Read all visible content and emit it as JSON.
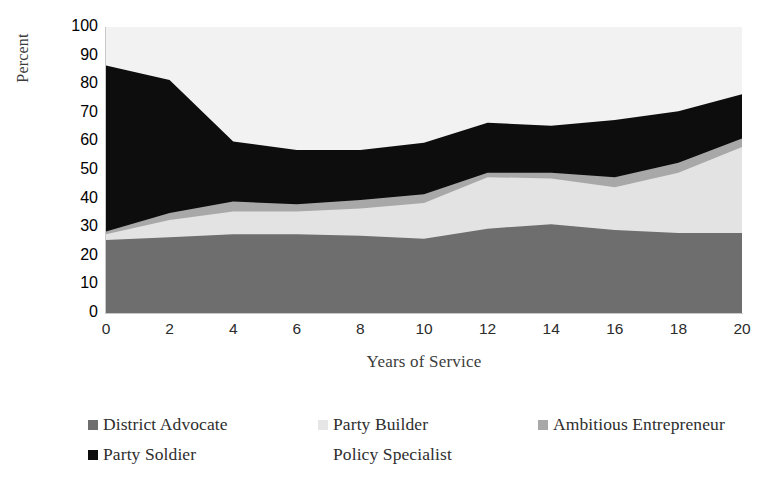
{
  "chart_data": {
    "type": "area",
    "stacked": true,
    "title": "",
    "xlabel": "Years of Service",
    "ylabel": "Percent",
    "x": [
      0,
      2,
      4,
      6,
      8,
      10,
      12,
      14,
      16,
      18,
      20
    ],
    "xlim": [
      0,
      20
    ],
    "ylim": [
      0,
      100
    ],
    "xticks": [
      "0",
      "2",
      "4",
      "6",
      "8",
      "10",
      "12",
      "14",
      "16",
      "18",
      "20"
    ],
    "yticks": [
      "0",
      "10",
      "20",
      "30",
      "40",
      "50",
      "60",
      "70",
      "80",
      "90",
      "100"
    ],
    "grid": false,
    "legend_position": "bottom",
    "series": [
      {
        "name": "District Advocate",
        "color": "#6e6e6e",
        "values": [
          25.5,
          26.5,
          27.5,
          27.5,
          27.0,
          26.0,
          29.5,
          31.0,
          29.0,
          28.0,
          28.0
        ]
      },
      {
        "name": "Party Builder",
        "color": "#e3e3e3",
        "values": [
          2.0,
          6.0,
          8.0,
          8.0,
          9.5,
          12.5,
          18.0,
          16.0,
          15.0,
          21.0,
          30.0
        ]
      },
      {
        "name": "Ambitious Entrepreneur",
        "color": "#a8a8a8",
        "values": [
          1.0,
          2.5,
          3.5,
          2.5,
          3.0,
          3.0,
          1.5,
          2.0,
          3.5,
          3.5,
          3.0
        ]
      },
      {
        "name": "Party Soldier",
        "color": "#0d0d0d",
        "values": [
          58.0,
          46.5,
          21.0,
          19.0,
          17.5,
          18.0,
          17.5,
          16.5,
          20.0,
          18.0,
          15.5
        ]
      },
      {
        "name": "Policy Specialist",
        "color": "#f2f2f2",
        "values": [
          13.5,
          18.5,
          40.0,
          43.0,
          43.0,
          40.5,
          33.5,
          34.5,
          32.5,
          29.5,
          23.5
        ]
      }
    ],
    "cumulative_tops": {
      "District Advocate": [
        25.5,
        26.5,
        27.5,
        27.5,
        27.0,
        26.0,
        29.5,
        31.0,
        29.0,
        28.0,
        28.0
      ],
      "Party Builder": [
        27.5,
        32.5,
        35.5,
        35.5,
        36.5,
        38.5,
        47.5,
        47.0,
        44.0,
        49.0,
        58.0
      ],
      "Ambitious Entrepreneur": [
        28.5,
        35.0,
        39.0,
        38.0,
        39.5,
        41.5,
        49.0,
        49.0,
        47.5,
        52.5,
        61.0
      ],
      "Party Soldier": [
        86.5,
        81.5,
        60.0,
        57.0,
        57.0,
        59.5,
        66.5,
        65.5,
        67.5,
        70.5,
        76.5
      ],
      "Policy Specialist": [
        100,
        100,
        100,
        100,
        100,
        100,
        100,
        100,
        100,
        100,
        100
      ]
    }
  },
  "legend": {
    "rows": [
      [
        {
          "label": "District Advocate",
          "color": "#6e6e6e",
          "swatch": "legend-swatch-district-advocate"
        },
        {
          "label": "Party Builder",
          "color": "#e6e6e6",
          "swatch": "legend-swatch-party-builder"
        },
        {
          "label": "Ambitious Entrepreneur",
          "color": "#a8a8a8",
          "swatch": "legend-swatch-ambitious-entrepreneur"
        }
      ],
      [
        {
          "label": "Party Soldier",
          "color": "#0d0d0d",
          "swatch": "legend-swatch-party-soldier"
        },
        {
          "label": "Policy Specialist",
          "color": "#ffffff",
          "swatch": "legend-swatch-policy-specialist"
        }
      ]
    ]
  },
  "axes": {
    "y_title": "Percent",
    "x_title": "Years of Service"
  }
}
